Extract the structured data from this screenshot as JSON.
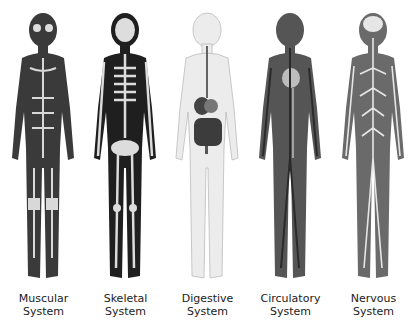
{
  "figures": [
    {
      "line1": "Muscular",
      "line2": "System",
      "body_color": "#3a3a3a",
      "detail_color": "#d8d8d8"
    },
    {
      "line1": "Skeletal",
      "line2": "System",
      "body_color": "#1f1f1f",
      "detail_color": "#dcdcdc"
    },
    {
      "line1": "Digestive",
      "line2": "System",
      "body_color": "#ececec",
      "detail_color": "#3c3c3c"
    },
    {
      "line1": "Circulatory",
      "line2": "System",
      "body_color": "#555555",
      "detail_color": "#bdbdbd"
    },
    {
      "line1": "Nervous",
      "line2": "System",
      "body_color": "#6a6a6a",
      "detail_color": "#e6e6e6"
    }
  ]
}
